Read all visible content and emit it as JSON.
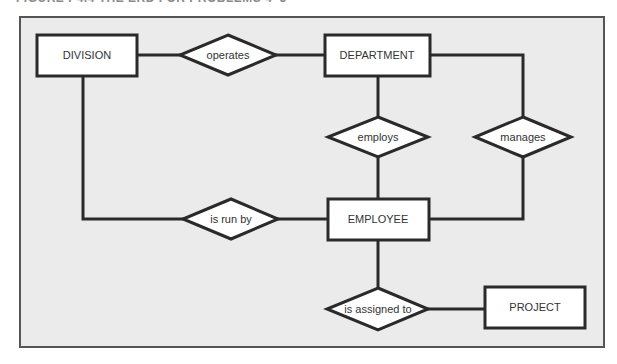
{
  "caption": "FIGURE P4.4  THE ERD FOR PROBLEMS 4–5",
  "colors": {
    "background": "#ebebeb",
    "frame": "#555555",
    "stroke": "#2a2a2a",
    "shape_fill": "#ffffff",
    "text": "#333333"
  },
  "entities": {
    "division": {
      "label": "DIVISION"
    },
    "department": {
      "label": "DEPARTMENT"
    },
    "employee": {
      "label": "EMPLOYEE"
    },
    "project": {
      "label": "PROJECT"
    }
  },
  "relationships": {
    "operates": {
      "label": "operates",
      "from": "DIVISION",
      "to": "DEPARTMENT"
    },
    "employs": {
      "label": "employs",
      "from": "DEPARTMENT",
      "to": "EMPLOYEE"
    },
    "manages": {
      "label": "manages",
      "from": "DEPARTMENT",
      "to": "EMPLOYEE"
    },
    "is_run_by": {
      "label": "is run by",
      "from": "DIVISION",
      "to": "EMPLOYEE"
    },
    "is_assigned_to": {
      "label": "is assigned to",
      "from": "EMPLOYEE",
      "to": "PROJECT"
    }
  }
}
